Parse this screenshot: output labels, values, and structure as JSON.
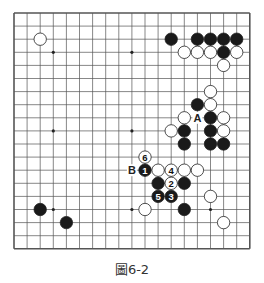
{
  "figure": {
    "caption": "圖6-2",
    "board_size": 19,
    "origin": {
      "x": 14,
      "y": 13
    },
    "spacing": 13.1,
    "star_points": [
      [
        3,
        3
      ],
      [
        9,
        3
      ],
      [
        15,
        3
      ],
      [
        3,
        9
      ],
      [
        9,
        9
      ],
      [
        15,
        9
      ],
      [
        3,
        15
      ],
      [
        9,
        15
      ],
      [
        15,
        15
      ]
    ],
    "stones": [
      {
        "col": 2,
        "row": 2,
        "color": "white"
      },
      {
        "col": 12,
        "row": 2,
        "color": "black"
      },
      {
        "col": 14,
        "row": 2,
        "color": "black"
      },
      {
        "col": 15,
        "row": 2,
        "color": "black"
      },
      {
        "col": 16,
        "row": 2,
        "color": "black"
      },
      {
        "col": 17,
        "row": 2,
        "color": "black"
      },
      {
        "col": 13,
        "row": 3,
        "color": "white"
      },
      {
        "col": 14,
        "row": 3,
        "color": "white"
      },
      {
        "col": 15,
        "row": 3,
        "color": "white"
      },
      {
        "col": 16,
        "row": 3,
        "color": "black"
      },
      {
        "col": 17,
        "row": 3,
        "color": "white"
      },
      {
        "col": 16,
        "row": 4,
        "color": "white"
      },
      {
        "col": 15,
        "row": 6,
        "color": "white"
      },
      {
        "col": 14,
        "row": 7,
        "color": "black"
      },
      {
        "col": 15,
        "row": 7,
        "color": "white"
      },
      {
        "col": 13,
        "row": 8,
        "color": "white"
      },
      {
        "col": 15,
        "row": 8,
        "color": "black"
      },
      {
        "col": 16,
        "row": 8,
        "color": "white"
      },
      {
        "col": 12,
        "row": 9,
        "color": "white"
      },
      {
        "col": 13,
        "row": 9,
        "color": "black"
      },
      {
        "col": 15,
        "row": 9,
        "color": "black"
      },
      {
        "col": 16,
        "row": 9,
        "color": "white"
      },
      {
        "col": 13,
        "row": 10,
        "color": "black"
      },
      {
        "col": 15,
        "row": 10,
        "color": "black"
      },
      {
        "col": 16,
        "row": 10,
        "color": "black"
      },
      {
        "col": 10,
        "row": 11,
        "color": "white",
        "label": "6"
      },
      {
        "col": 10,
        "row": 12,
        "color": "black",
        "label": "1"
      },
      {
        "col": 11,
        "row": 12,
        "color": "white"
      },
      {
        "col": 12,
        "row": 12,
        "color": "white",
        "label": "4"
      },
      {
        "col": 13,
        "row": 12,
        "color": "white"
      },
      {
        "col": 14,
        "row": 12,
        "color": "white"
      },
      {
        "col": 11,
        "row": 13,
        "color": "black"
      },
      {
        "col": 12,
        "row": 13,
        "color": "white",
        "label": "2"
      },
      {
        "col": 13,
        "row": 13,
        "color": "black"
      },
      {
        "col": 11,
        "row": 14,
        "color": "black",
        "label": "5"
      },
      {
        "col": 12,
        "row": 14,
        "color": "black",
        "label": "3"
      },
      {
        "col": 15,
        "row": 14,
        "color": "white"
      },
      {
        "col": 2,
        "row": 15,
        "color": "black"
      },
      {
        "col": 10,
        "row": 15,
        "color": "white"
      },
      {
        "col": 13,
        "row": 15,
        "color": "black"
      },
      {
        "col": 4,
        "row": 16,
        "color": "black"
      },
      {
        "col": 16,
        "row": 16,
        "color": "white"
      }
    ],
    "markers": [
      {
        "col": 14,
        "row": 8,
        "label": "A"
      },
      {
        "col": 9,
        "row": 12,
        "label": "B"
      }
    ]
  }
}
